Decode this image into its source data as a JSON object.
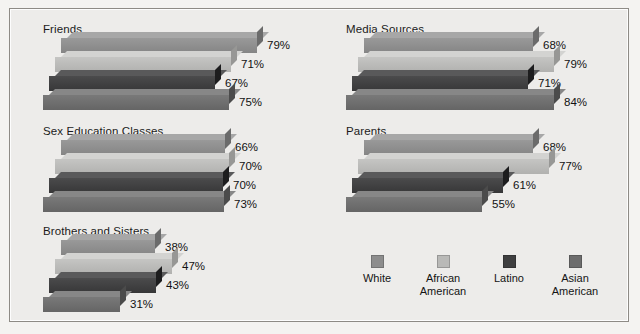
{
  "chart_data": {
    "type": "bar",
    "title": "",
    "subtitle": "",
    "xlabel": "",
    "ylabel": "",
    "orientation": "horizontal",
    "grid": false,
    "legend_position": "bottom-right",
    "xlim": [
      0,
      100
    ],
    "value_suffix": "%",
    "categories": [
      "White",
      "African American",
      "Latino",
      "Asian American"
    ],
    "series_axis": "panel",
    "panels": [
      {
        "title": "Friends",
        "values": [
          79,
          71,
          67,
          75
        ],
        "labels": [
          "79%",
          "71%",
          "67%",
          "75%"
        ]
      },
      {
        "title": "Sex Education Classes",
        "values": [
          66,
          70,
          70,
          73
        ],
        "labels": [
          "66%",
          "70%",
          "70%",
          "73%"
        ]
      },
      {
        "title": "Brothers and Sisters",
        "values": [
          38,
          47,
          43,
          31
        ],
        "labels": [
          "38%",
          "47%",
          "43%",
          "31%"
        ]
      },
      {
        "title": "Media Sources",
        "values": [
          68,
          79,
          71,
          84
        ],
        "labels": [
          "68%",
          "79%",
          "71%",
          "84%"
        ]
      },
      {
        "title": "Parents",
        "values": [
          68,
          77,
          61,
          55
        ],
        "labels": [
          "68%",
          "77%",
          "61%",
          "55%"
        ]
      }
    ],
    "series_colors": [
      "#8d8d8d",
      "#b9b9b7",
      "#3f3f40",
      "#6d6d6d"
    ]
  },
  "legend": {
    "items": [
      {
        "label_line1": "White",
        "label_line2": "",
        "color": "#8d8d8d"
      },
      {
        "label_line1": "African",
        "label_line2": "American",
        "color": "#b9b9b7"
      },
      {
        "label_line1": "Latino",
        "label_line2": "",
        "color": "#3f3f40"
      },
      {
        "label_line1": "Asian",
        "label_line2": "American",
        "color": "#6d6d6d"
      }
    ]
  },
  "figure": {
    "background": "#edecea",
    "border_color": "#8e8b86"
  }
}
